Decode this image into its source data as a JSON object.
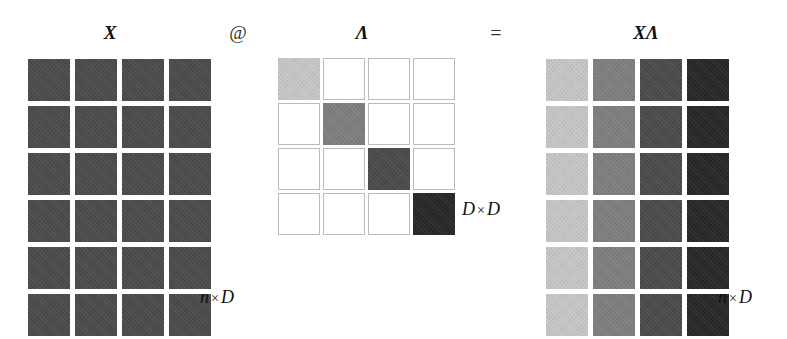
{
  "figure": {
    "kind": "matrix-multiplication-diagram",
    "background": "#ffffff"
  },
  "labels": {
    "x_matrix": "X",
    "lambda_matrix": "Λ",
    "product_matrix": "XΛ",
    "operator_matmul": "@",
    "operator_equals": "=",
    "dim_x": "n × D",
    "dim_lambda": "D × D",
    "dim_product": "n × D",
    "times_symbol": "×",
    "dim_x_left": "n",
    "dim_x_right": "D",
    "dim_lambda_left": "D",
    "dim_lambda_right": "D",
    "dim_product_left": "n",
    "dim_product_right": "D"
  },
  "palette": {
    "x_uniform": "#4b4b4b",
    "empty_cell_fill": "#ffffff",
    "empty_cell_border": "#bcbcbc",
    "diag_1": "#c5c5c5",
    "diag_2": "#7e7e7e",
    "diag_3": "#4b4b4b",
    "diag_4": "#282828",
    "text": "#111111"
  },
  "matrices": {
    "X": {
      "name": "X",
      "rows": 6,
      "cols": 4,
      "dim_text": "n × D",
      "cell_colors": [
        [
          "#4b4b4b",
          "#4b4b4b",
          "#4b4b4b",
          "#4b4b4b"
        ],
        [
          "#4b4b4b",
          "#4b4b4b",
          "#4b4b4b",
          "#4b4b4b"
        ],
        [
          "#4b4b4b",
          "#4b4b4b",
          "#4b4b4b",
          "#4b4b4b"
        ],
        [
          "#4b4b4b",
          "#4b4b4b",
          "#4b4b4b",
          "#4b4b4b"
        ],
        [
          "#4b4b4b",
          "#4b4b4b",
          "#4b4b4b",
          "#4b4b4b"
        ],
        [
          "#4b4b4b",
          "#4b4b4b",
          "#4b4b4b",
          "#4b4b4b"
        ]
      ]
    },
    "Lambda": {
      "name": "Λ",
      "rows": 4,
      "cols": 4,
      "dim_text": "D × D",
      "diagonal_colors": [
        "#c5c5c5",
        "#7e7e7e",
        "#4b4b4b",
        "#282828"
      ],
      "cell_colors": [
        [
          "#c5c5c5",
          null,
          null,
          null
        ],
        [
          null,
          "#7e7e7e",
          null,
          null
        ],
        [
          null,
          null,
          "#4b4b4b",
          null
        ],
        [
          null,
          null,
          null,
          "#282828"
        ]
      ]
    },
    "XLambda": {
      "name": "XΛ",
      "rows": 6,
      "cols": 4,
      "dim_text": "n × D",
      "column_colors": [
        "#c5c5c5",
        "#7e7e7e",
        "#4b4b4b",
        "#282828"
      ],
      "cell_colors": [
        [
          "#c5c5c5",
          "#7e7e7e",
          "#4b4b4b",
          "#282828"
        ],
        [
          "#c5c5c5",
          "#7e7e7e",
          "#4b4b4b",
          "#282828"
        ],
        [
          "#c5c5c5",
          "#7e7e7e",
          "#4b4b4b",
          "#282828"
        ],
        [
          "#c5c5c5",
          "#7e7e7e",
          "#4b4b4b",
          "#282828"
        ],
        [
          "#c5c5c5",
          "#7e7e7e",
          "#4b4b4b",
          "#282828"
        ],
        [
          "#c5c5c5",
          "#7e7e7e",
          "#4b4b4b",
          "#282828"
        ]
      ]
    }
  }
}
